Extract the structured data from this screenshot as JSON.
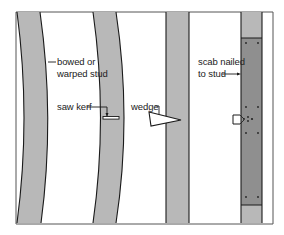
{
  "figure": {
    "colors": {
      "stud_fill": "#b8b8b8",
      "scab_fill": "#8f8f8f",
      "line": "#1a1a1a",
      "frame": "#555555",
      "background": "#ffffff"
    },
    "labels": {
      "bowed": [
        "bowed or",
        "warped stud"
      ],
      "saw_kerf": "saw kerf",
      "wedge": "wedge",
      "scab": [
        "scab nailed",
        "to stud"
      ]
    },
    "elements": [
      {
        "id": "stud-1",
        "type": "bowed stud"
      },
      {
        "id": "stud-2",
        "type": "bowed stud with saw kerf"
      },
      {
        "id": "stud-3",
        "type": "straight stud with wedge"
      },
      {
        "id": "stud-4",
        "type": "stud with scab nailed"
      }
    ]
  }
}
